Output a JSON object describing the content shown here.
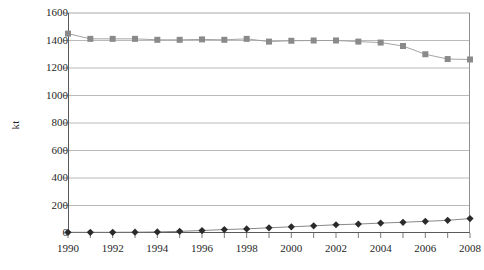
{
  "chart_data": {
    "type": "line",
    "title": "",
    "xlabel": "",
    "ylabel": "kt",
    "xlim": [
      1990,
      2008
    ],
    "ylim": [
      0,
      1600
    ],
    "ytick_labels": [
      "0",
      "200",
      "400",
      "600",
      "800",
      "1000",
      "1200",
      "1400",
      "1600"
    ],
    "ytick_values": [
      0,
      200,
      400,
      600,
      800,
      1000,
      1200,
      1400,
      1600
    ],
    "xtick_labels": [
      "1990",
      "1992",
      "1994",
      "1996",
      "1998",
      "2000",
      "2002",
      "2004",
      "2006",
      "2008"
    ],
    "xtick_values": [
      1990,
      1992,
      1994,
      1996,
      1998,
      2000,
      2002,
      2004,
      2006,
      2008
    ],
    "x": [
      1990,
      1991,
      1992,
      1993,
      1994,
      1995,
      1996,
      1997,
      1998,
      1999,
      2000,
      2001,
      2002,
      2003,
      2004,
      2005,
      2006,
      2007,
      2008
    ],
    "grid": true,
    "grid_axis": "y",
    "legend": "none",
    "series": [
      {
        "name": "upper-series",
        "marker": "square",
        "color": "#8a8a8a",
        "line_color": "#9a9a9a",
        "values": [
          1450,
          1412,
          1412,
          1412,
          1405,
          1405,
          1408,
          1405,
          1412,
          1392,
          1398,
          1400,
          1400,
          1392,
          1385,
          1360,
          1300,
          1265,
          1262
        ]
      },
      {
        "name": "lower-series",
        "marker": "diamond",
        "color": "#2b2b2b",
        "line_color": "#7a7a7a",
        "values": [
          5,
          5,
          5,
          6,
          8,
          12,
          18,
          25,
          30,
          38,
          45,
          52,
          60,
          65,
          72,
          78,
          85,
          92,
          105
        ]
      }
    ],
    "colors": {
      "axis": "#5a5a5a",
      "grid": "#a8a8a8",
      "plot_border": "#8f8f8f",
      "text": "#1f1f1f",
      "background": "#ffffff"
    }
  }
}
